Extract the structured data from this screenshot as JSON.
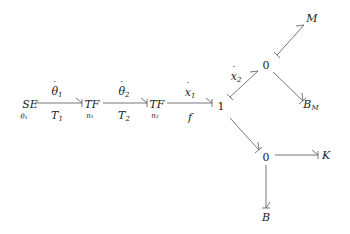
{
  "diagram": {
    "type": "bond-graph",
    "line_color": "#555555",
    "nodes": {
      "se": {
        "label": "SE",
        "sub": "θ₁"
      },
      "tf1": {
        "label": "TF",
        "sub": "n₁"
      },
      "tf2": {
        "label": "TF",
        "sub": "n₂"
      },
      "one": {
        "label": "1"
      },
      "zero_top": {
        "label": "0"
      },
      "zero_bottom": {
        "label": "0"
      },
      "m": {
        "label": "M"
      },
      "bm": {
        "label": "B",
        "sub": "M"
      },
      "k": {
        "label": "K"
      },
      "b": {
        "label": "B"
      }
    },
    "bonds": [
      {
        "from": "SE",
        "to": "TF (n₁)",
        "flow": "θ₁",
        "effort": "T₁"
      },
      {
        "from": "TF (n₁)",
        "to": "TF (n₂)",
        "flow": "θ₂",
        "effort": "T₂"
      },
      {
        "from": "TF (n₂)",
        "to": "1",
        "flow": "x₁",
        "effort": "f"
      },
      {
        "from": "1",
        "to": "0 (top)",
        "flow": "x₂"
      },
      {
        "from": "0 (top)",
        "to": "M"
      },
      {
        "from": "0 (top)",
        "to": "B_M"
      },
      {
        "from": "1",
        "to": "0 (bottom)"
      },
      {
        "from": "0 (bottom)",
        "to": "K"
      },
      {
        "from": "0 (bottom)",
        "to": "B"
      }
    ],
    "labels": {
      "theta1": "θ",
      "theta1_sub": "1",
      "t1": "T",
      "t1_sub": "1",
      "theta2": "θ",
      "theta2_sub": "2",
      "t2": "T",
      "t2_sub": "2",
      "x1": "x",
      "x1_sub": "1",
      "f": "f",
      "x2": "x",
      "x2_sub": "2"
    }
  }
}
